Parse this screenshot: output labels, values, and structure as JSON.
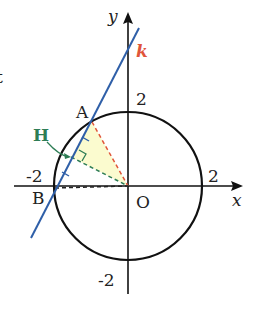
{
  "diagram": {
    "axes": {
      "x_label": "x",
      "y_label": "y",
      "origin_label": "O"
    },
    "ticks": {
      "x_pos": "2",
      "x_neg": "-2",
      "y_pos": "2",
      "y_neg": "-2"
    },
    "points": {
      "A": "A",
      "B": "B",
      "H": "H"
    },
    "line_label": "k",
    "partial_text": "t",
    "colors": {
      "line_k": "#2f5fa8",
      "label_k": "#e0553a",
      "label_H": "#2e7d55",
      "dashed_OA": "#e0553a",
      "dashed_OH": "#2e7d55",
      "dashed_OB": "#222222",
      "triangle_fill": "#fbfbcf",
      "circle": "#111111"
    },
    "circle": {
      "radius": 2
    }
  }
}
